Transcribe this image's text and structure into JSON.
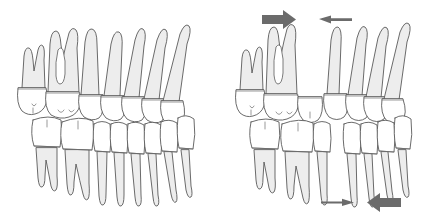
{
  "figure": {
    "background_color": "#ffffff",
    "tooth_fill": "#ffffff",
    "root_shade": "#ededed",
    "outline_color": "#5a5a5a",
    "arrow_color": "#6b6b6b",
    "panel_count": 2
  },
  "panels": [
    {
      "id": "panel-left",
      "label": "normal-occlusion",
      "description": "Lateral view of upper and lower teeth in contact, no spacing",
      "arrows": [],
      "arches": [
        {
          "name": "upper-arch",
          "tooth_count": 7,
          "teeth": [
            {
              "name": "upper-second-molar",
              "roots": 2,
              "root_canal": false
            },
            {
              "name": "upper-first-molar",
              "roots": 2,
              "root_canal": true
            },
            {
              "name": "upper-second-premolar",
              "roots": 1,
              "root_canal": false
            },
            {
              "name": "upper-first-premolar",
              "roots": 1,
              "root_canal": false
            },
            {
              "name": "upper-canine",
              "roots": 1,
              "root_canal": false
            },
            {
              "name": "upper-lateral-incisor",
              "roots": 1,
              "root_canal": false
            },
            {
              "name": "upper-central-incisor",
              "roots": 1,
              "root_canal": false
            }
          ]
        },
        {
          "name": "lower-arch",
          "tooth_count": 7,
          "teeth": [
            {
              "name": "lower-second-molar",
              "roots": 2,
              "root_canal": false
            },
            {
              "name": "lower-first-molar",
              "roots": 2,
              "root_canal": false
            },
            {
              "name": "lower-second-premolar",
              "roots": 1,
              "root_canal": false
            },
            {
              "name": "lower-first-premolar",
              "roots": 1,
              "root_canal": false
            },
            {
              "name": "lower-canine",
              "roots": 1,
              "root_canal": false
            },
            {
              "name": "lower-lateral-incisor",
              "roots": 1,
              "root_canal": false
            },
            {
              "name": "lower-central-incisor",
              "roots": 1,
              "root_canal": false
            }
          ]
        }
      ]
    },
    {
      "id": "panel-right",
      "label": "tooth-movement-with-space",
      "description": "Same arches after mesial and distal movement, extraction space opened between premolar and molar segments",
      "arrows": [
        {
          "name": "upper-posterior-force-arrow",
          "direction": "right",
          "weight": "thick",
          "position": "top-left"
        },
        {
          "name": "upper-anterior-force-arrow",
          "direction": "left",
          "weight": "thin",
          "position": "top-right"
        },
        {
          "name": "lower-posterior-force-arrow",
          "direction": "right",
          "weight": "thin",
          "position": "bottom-left"
        },
        {
          "name": "lower-anterior-force-arrow",
          "direction": "left",
          "weight": "thick",
          "position": "bottom-right"
        }
      ],
      "arches": [
        {
          "name": "upper-arch",
          "tooth_count": 7,
          "space_after_index": 2,
          "teeth": [
            {
              "name": "upper-second-molar",
              "roots": 2,
              "root_canal": false
            },
            {
              "name": "upper-first-molar",
              "roots": 2,
              "root_canal": true
            },
            {
              "name": "upper-second-premolar",
              "roots": 1,
              "root_canal": false
            },
            {
              "name": "upper-first-premolar",
              "roots": 1,
              "root_canal": false
            },
            {
              "name": "upper-canine",
              "roots": 1,
              "root_canal": false
            },
            {
              "name": "upper-lateral-incisor",
              "roots": 1,
              "root_canal": false
            },
            {
              "name": "upper-central-incisor",
              "roots": 1,
              "root_canal": false
            }
          ]
        },
        {
          "name": "lower-arch",
          "tooth_count": 7,
          "space_after_index": 3,
          "teeth": [
            {
              "name": "lower-second-molar",
              "roots": 2,
              "root_canal": false
            },
            {
              "name": "lower-first-molar",
              "roots": 2,
              "root_canal": false
            },
            {
              "name": "lower-second-premolar",
              "roots": 1,
              "root_canal": false
            },
            {
              "name": "lower-first-premolar",
              "roots": 1,
              "root_canal": false
            },
            {
              "name": "lower-canine",
              "roots": 1,
              "root_canal": false
            },
            {
              "name": "lower-lateral-incisor",
              "roots": 1,
              "root_canal": false
            },
            {
              "name": "lower-central-incisor",
              "roots": 1,
              "root_canal": false
            }
          ]
        }
      ]
    }
  ]
}
